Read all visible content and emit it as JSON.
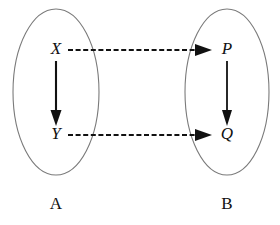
{
  "figure": {
    "background_color": "#ffffff",
    "width": 280,
    "height": 225
  },
  "sets": {
    "left": {
      "name": "A",
      "label": "A",
      "outline_color": "#7a7a7a",
      "center_x": 56,
      "center_y": 92,
      "radius_x": 43,
      "radius_y": 83,
      "label_x": 56,
      "label_y": 205
    },
    "right": {
      "name": "B",
      "label": "B",
      "outline_color": "#7a7a7a",
      "center_x": 227,
      "center_y": 92,
      "radius_x": 42,
      "radius_y": 83,
      "label_x": 227,
      "label_y": 205
    }
  },
  "nodes": [
    {
      "id": "X",
      "label": "X",
      "x": 56,
      "y": 50,
      "set": "A",
      "color": "#111111"
    },
    {
      "id": "Y",
      "label": "Y",
      "x": 56,
      "y": 135,
      "set": "A",
      "color": "#111111"
    },
    {
      "id": "P",
      "label": "P",
      "x": 227,
      "y": 50,
      "set": "B",
      "color": "#111111"
    },
    {
      "id": "Q",
      "label": "Q",
      "x": 227,
      "y": 135,
      "set": "B",
      "color": "#111111"
    }
  ],
  "arrows": [
    {
      "id": "x-to-y",
      "from": "X",
      "to": "Y",
      "style": "solid",
      "orientation": "vertical",
      "color": "#111111",
      "label": ""
    },
    {
      "id": "p-to-q",
      "from": "P",
      "to": "Q",
      "style": "solid",
      "orientation": "vertical",
      "color": "#111111",
      "label": ""
    },
    {
      "id": "x-to-p",
      "from": "X",
      "to": "P",
      "style": "dashed",
      "orientation": "horizontal",
      "color": "#111111",
      "label": ""
    },
    {
      "id": "y-to-q",
      "from": "Y",
      "to": "Q",
      "style": "dashed",
      "orientation": "horizontal",
      "color": "#111111",
      "label": ""
    }
  ]
}
